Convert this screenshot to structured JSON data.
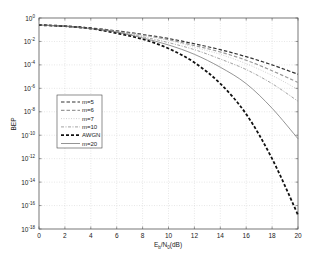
{
  "chart_data": {
    "type": "line",
    "title": "",
    "xlabel": "E_b/N_0(dB)",
    "xlabel_parts": {
      "E": "E",
      "b": "b",
      "slash": "/N",
      "zero": "0",
      "tail": "(dB)"
    },
    "ylabel": "BEP",
    "yscale": "log",
    "xlim": [
      0,
      20
    ],
    "ylim_exponent": [
      -18,
      0
    ],
    "grid": true,
    "legend_position": "left-middle",
    "x_ticks": [
      "0",
      "2",
      "4",
      "6",
      "8",
      "10",
      "12",
      "14",
      "16",
      "18",
      "20"
    ],
    "y_ticks": [
      {
        "base": "10",
        "exp": "0"
      },
      {
        "base": "10",
        "exp": "-2"
      },
      {
        "base": "10",
        "exp": "-4"
      },
      {
        "base": "10",
        "exp": "-6"
      },
      {
        "base": "10",
        "exp": "-8"
      },
      {
        "base": "10",
        "exp": "-10"
      },
      {
        "base": "10",
        "exp": "-12"
      },
      {
        "base": "10",
        "exp": "-14"
      },
      {
        "base": "10",
        "exp": "-16"
      },
      {
        "base": "10",
        "exp": "-18"
      }
    ],
    "x": [
      0,
      2,
      4,
      6,
      8,
      10,
      12,
      14,
      16,
      18,
      20
    ],
    "series": [
      {
        "name": "m=5",
        "color": "#333333",
        "style": "dashed",
        "log10_values": [
          -0.6,
          -0.7,
          -0.85,
          -1.1,
          -1.4,
          -1.75,
          -2.2,
          -2.7,
          -3.3,
          -4.0,
          -4.8
        ]
      },
      {
        "name": "m=6",
        "color": "#9a9a9a",
        "style": "dashed",
        "log10_values": [
          -0.6,
          -0.7,
          -0.9,
          -1.15,
          -1.45,
          -1.85,
          -2.35,
          -2.9,
          -3.6,
          -4.5,
          -5.5
        ]
      },
      {
        "name": "m=7",
        "color": "#c4c4c4",
        "style": "dotted",
        "log10_values": [
          -0.6,
          -0.7,
          -0.9,
          -1.2,
          -1.5,
          -1.9,
          -2.5,
          -3.1,
          -3.9,
          -4.9,
          -6.1
        ]
      },
      {
        "name": "m=10",
        "color": "#8a8a8a",
        "style": "dashdot",
        "log10_values": [
          -0.6,
          -0.7,
          -0.9,
          -1.2,
          -1.6,
          -2.1,
          -2.7,
          -3.5,
          -4.4,
          -5.6,
          -7.1
        ]
      },
      {
        "name": "AWGN",
        "color": "#111111",
        "style": "thickdash",
        "log10_values": [
          -0.6,
          -0.7,
          -0.9,
          -1.3,
          -1.8,
          -2.6,
          -3.8,
          -5.6,
          -8.2,
          -12.0,
          -16.8
        ]
      },
      {
        "name": "m=20",
        "color": "#7a7a7a",
        "style": "solid",
        "log10_values": [
          -0.6,
          -0.7,
          -0.9,
          -1.2,
          -1.7,
          -2.3,
          -3.1,
          -4.2,
          -5.6,
          -7.7,
          -10.3
        ]
      }
    ]
  }
}
